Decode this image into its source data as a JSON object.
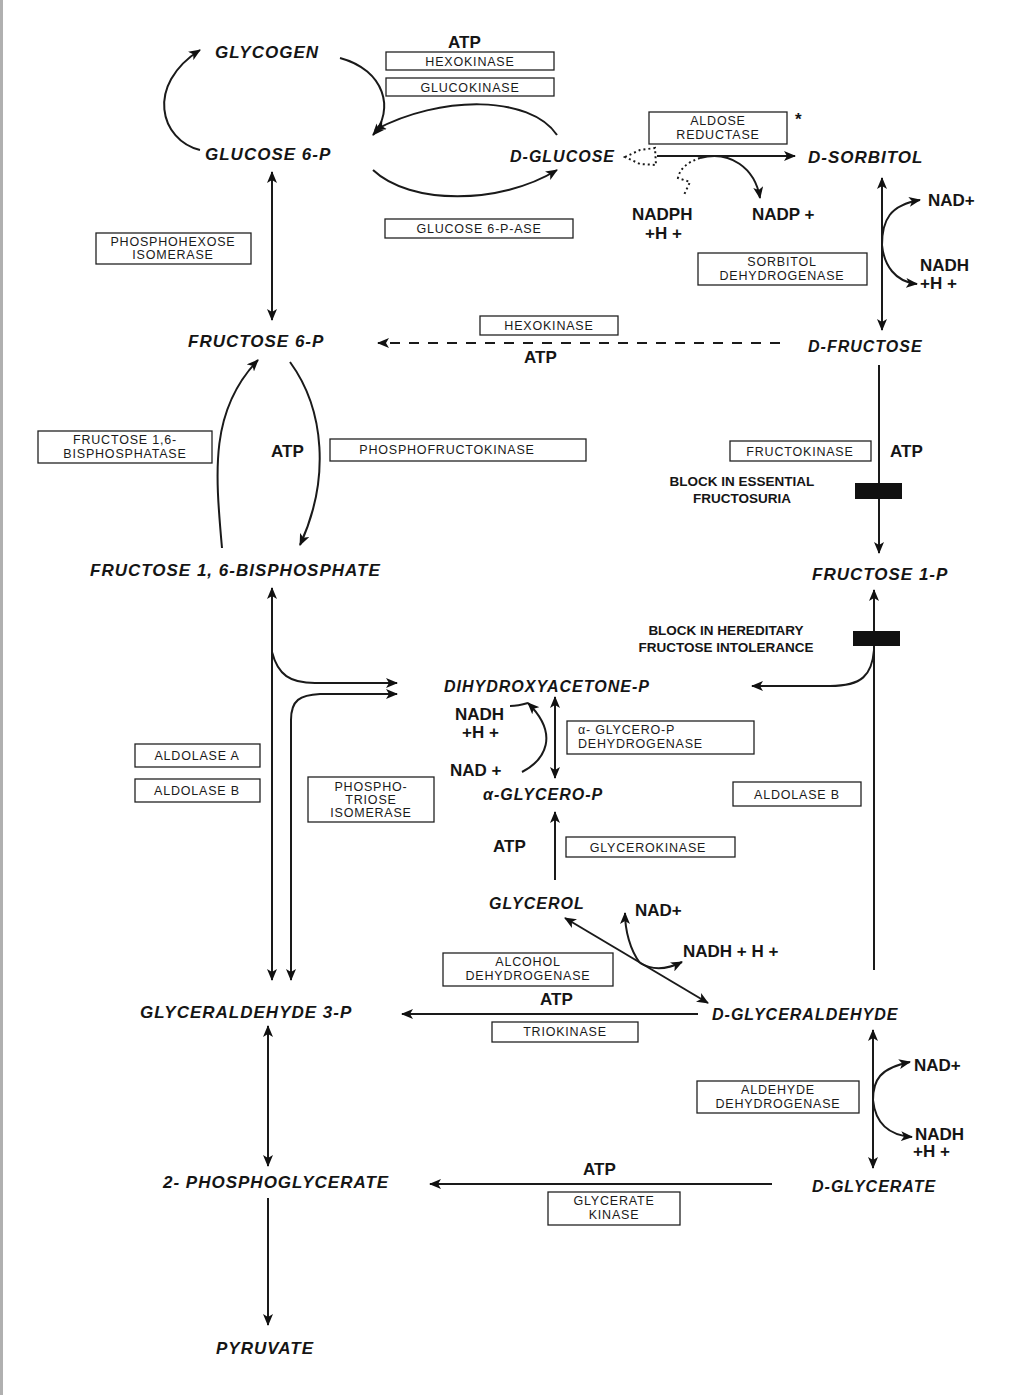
{
  "metabolites": {
    "glycogen": "GLYCOGEN",
    "glucose6p": "GLUCOSE 6-P",
    "d_glucose": "D-GLUCOSE",
    "d_sorbitol": "D-SORBITOL",
    "fructose6p": "FRUCTOSE 6-P",
    "d_fructose": "D-FRUCTOSE",
    "fructose16bp": "FRUCTOSE 1, 6-BISPHOSPHATE",
    "fructose1p": "FRUCTOSE 1-P",
    "dhap": "DIHYDROXYACETONE-P",
    "a_glycerop": "α-GLYCERO-P",
    "glycerol": "GLYCEROL",
    "glyceraldehyde3p": "GLYCERALDEHYDE 3-P",
    "d_glyceraldehyde": "D-GLYCERALDEHYDE",
    "phosphoglycerate2": "2- PHOSPHOGLYCERATE",
    "d_glycerate": "D-GLYCERATE",
    "pyruvate": "PYRUVATE"
  },
  "enzymes": {
    "hexokinase_top": "HEXOKINASE",
    "glucokinase": "GLUCOKINASE",
    "glucose6pase": "GLUCOSE 6-P-ASE",
    "aldose_reductase": [
      "ALDOSE",
      "REDUCTASE"
    ],
    "aldose_reductase_mark": "*",
    "phosphohexose_isomerase": [
      "PHOSPHOHEXOSE",
      "ISOMERASE"
    ],
    "sorbitol_dehydrogenase": [
      "SORBITOL",
      "DEHYDROGENASE"
    ],
    "hexokinase_mid": "HEXOKINASE",
    "fructose_bisphosphatase": [
      "FRUCTOSE 1,6-",
      "BISPHOSPHATASE"
    ],
    "phosphofructokinase": "PHOSPHOFRUCTOKINASE",
    "fructokinase": "FRUCTOKINASE",
    "aldolase_a": "ALDOLASE A",
    "aldolase_b_left": "ALDOLASE B",
    "aldolase_b_right": "ALDOLASE B",
    "phosphotriose_isomerase": [
      "PHOSPHO-",
      "TRIOSE",
      "ISOMERASE"
    ],
    "glycerop_dehydrogenase": [
      "α- GLYCERO-P",
      "DEHYDROGENASE"
    ],
    "glycerokinase": "GLYCEROKINASE",
    "alcohol_dehydrogenase": [
      "ALCOHOL",
      "DEHYDROGENASE"
    ],
    "triokinase": "TRIOKINASE",
    "aldehyde_dehydrogenase": [
      "ALDEHYDE",
      "DEHYDROGENASE"
    ],
    "glycerate_kinase": [
      "GLYCERATE",
      "KINASE"
    ]
  },
  "cofactors": {
    "atp_hexokinase": "ATP",
    "nadph": [
      "NADPH",
      "+H +"
    ],
    "nadp": "NADP +",
    "nad_sorbitol": "NAD+",
    "nadh_sorbitol": [
      "NADH",
      "+H +"
    ],
    "atp_fructose6p": "ATP",
    "atp_pfk": "ATP",
    "atp_fructokinase": "ATP",
    "nadh_glycerop": [
      "NADH",
      "+H +"
    ],
    "nad_glycerop": "NAD +",
    "atp_glycerokinase": "ATP",
    "nad_alcohol": "NAD+",
    "nadh_alcohol": "NADH + H +",
    "atp_triokinase": "ATP",
    "nad_aldehyde": "NAD+",
    "nadh_aldehyde": [
      "NADH",
      "+H +"
    ],
    "atp_glycerate": "ATP"
  },
  "blocks": {
    "essential_fructosuria": [
      "BLOCK IN ESSENTIAL",
      "FRUCTOSURIA"
    ],
    "hereditary_intolerance": [
      "BLOCK IN HEREDITARY",
      "FRUCTOSE INTOLERANCE"
    ]
  }
}
